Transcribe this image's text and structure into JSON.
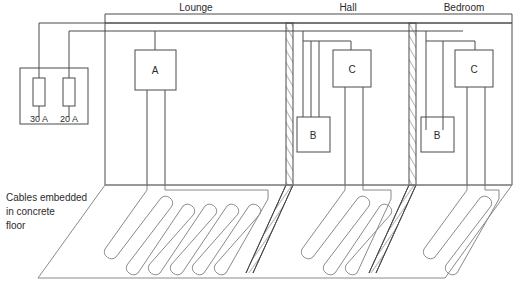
{
  "diagram": {
    "title_labels": {
      "lounge": "Lounge",
      "hall": "Hall",
      "bedroom": "Bedroom"
    },
    "note": {
      "line1": "Cables embedded",
      "line2": "in concrete",
      "line3": "floor"
    },
    "fusebox": {
      "fuse1_label": "30 A",
      "fuse2_label": "20 A"
    },
    "boxes": {
      "lounge_a": "A",
      "hall_b": "B",
      "hall_c": "C",
      "bedroom_b": "B",
      "bedroom_c": "C"
    },
    "colors": {
      "line": "#4a4a4a",
      "line_light": "#8a8a8a",
      "text": "#2b2b2b",
      "background": "#ffffff"
    }
  }
}
